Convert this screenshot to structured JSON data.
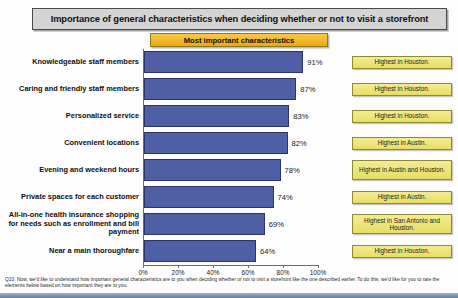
{
  "header": {
    "title": "Importance of general characteristics when deciding whether or not to visit a storefront",
    "subtitle": "Most important characteristics"
  },
  "footnote": "Q10. Now, we'd like to understand how important general characteristics are to you when deciding whether or not to visit a storefront like the one described earlier. To do this, we'd like for you to rate the elements below based on how important they are to you.",
  "colors": {
    "bar": "#4f5fa6",
    "bar_outline": "#2e3566",
    "title_banner": "#d4d4d4",
    "subtitle_banner": "#f0b323",
    "note_box": "#eee87f"
  },
  "annotations": [
    {
      "text": "Highest in Houston."
    },
    {
      "text": "Highest in Houston."
    },
    {
      "text": "Highest in Houston."
    },
    {
      "text": "Highest in Austin."
    },
    {
      "text": "Highest in Austin and Houston."
    },
    {
      "text": "Highest in Austin."
    },
    {
      "text": "Highest in San Antonio and Houston."
    },
    {
      "text": "Highest in Houston."
    }
  ],
  "chart_data": {
    "type": "bar",
    "orientation": "horizontal",
    "title": "Importance of general characteristics when deciding whether or not to visit a storefront",
    "subtitle": "Most important characteristics",
    "xlabel": "",
    "ylabel": "",
    "xlim": [
      0,
      100
    ],
    "grid": false,
    "legend": "none",
    "tick_labels": [
      "0%",
      "20%",
      "40%",
      "60%",
      "80%",
      "100%"
    ],
    "ticks": [
      0,
      20,
      40,
      60,
      80,
      100
    ],
    "categories": [
      "Knowledgeable staff members",
      "Caring and friendly staff members",
      "Personalized service",
      "Convenient locations",
      "Evening and weekend hours",
      "Private spaces for each customer",
      "All-in-one health insurance shopping for needs such as enrollment and bill payment",
      "Near a main thoroughfare"
    ],
    "values": [
      91,
      87,
      83,
      82,
      78,
      74,
      69,
      64
    ],
    "data_labels": [
      "91%",
      "87%",
      "83%",
      "82%",
      "78%",
      "74%",
      "69%",
      "64%"
    ]
  }
}
